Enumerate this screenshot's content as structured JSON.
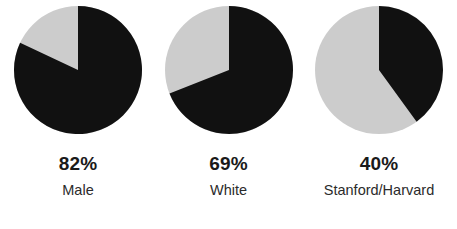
{
  "chart_data": [
    {
      "type": "pie",
      "title": "",
      "categories": [
        "Male",
        "Other"
      ],
      "values": [
        82,
        18
      ],
      "colors": [
        "#111111",
        "#cccccc"
      ],
      "label_percent": "82%",
      "label_text": "Male",
      "start_angle_deg": 0,
      "direction": "clockwise",
      "legend": "none",
      "grid": false
    },
    {
      "type": "pie",
      "title": "",
      "categories": [
        "White",
        "Other"
      ],
      "values": [
        69,
        31
      ],
      "colors": [
        "#111111",
        "#cccccc"
      ],
      "label_percent": "69%",
      "label_text": "White",
      "start_angle_deg": 0,
      "direction": "clockwise",
      "legend": "none",
      "grid": false
    },
    {
      "type": "pie",
      "title": "",
      "categories": [
        "Stanford/Harvard",
        "Other"
      ],
      "values": [
        40,
        60
      ],
      "colors": [
        "#111111",
        "#cccccc"
      ],
      "label_percent": "40%",
      "label_text": "Stanford/Harvard",
      "start_angle_deg": 0,
      "direction": "clockwise",
      "legend": "none",
      "grid": false
    }
  ],
  "palette": {
    "filled": "#111111",
    "remainder": "#cccccc",
    "background": "#ffffff",
    "percent_text": "#1a1a1a",
    "label_text": "#2b2b2b"
  },
  "charts": [
    {
      "percent": "82%",
      "label": "Male"
    },
    {
      "percent": "69%",
      "label": "White"
    },
    {
      "percent": "40%",
      "label": "Stanford/Harvard"
    }
  ]
}
